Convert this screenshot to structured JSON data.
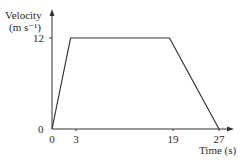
{
  "chart_data": {
    "type": "line",
    "title": "",
    "xlabel": "Time (s)",
    "ylabel": "Velocity (m s⁻¹)",
    "ylabel_line1": "Velocity",
    "ylabel_line2": "(m s⁻¹)",
    "x": [
      0,
      3,
      19,
      27
    ],
    "series": [
      {
        "name": "velocity",
        "values": [
          0,
          12,
          12,
          0
        ]
      }
    ],
    "x_ticks": [
      "0",
      "3",
      "19",
      "27"
    ],
    "y_ticks": [
      "0",
      "12"
    ],
    "xlim": [
      0,
      28.5
    ],
    "ylim": [
      0,
      15.5
    ],
    "grid": false,
    "legend": "none",
    "colors": {
      "line": "#333333",
      "axis": "#333333"
    }
  }
}
